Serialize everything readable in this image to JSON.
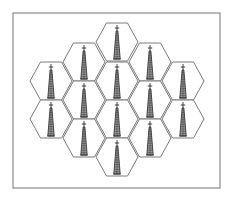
{
  "diagram": {
    "frame": {
      "x": 13,
      "y": 13,
      "width": 207,
      "height": 175,
      "stroke": "#8a8a8a"
    },
    "hex": {
      "width": 42,
      "height": 38,
      "stroke": "#7a7a7a",
      "fill": "#ffffff"
    },
    "tower": {
      "icon": "cell-tower-icon",
      "color": "#2e2e2e",
      "half_height": 17,
      "base_half_width": 3.2
    },
    "cells": [
      {
        "id": "cell-1",
        "cx": 117,
        "cy": 42
      },
      {
        "id": "cell-2",
        "cx": 84,
        "cy": 62
      },
      {
        "id": "cell-3",
        "cx": 150,
        "cy": 62
      },
      {
        "id": "cell-4",
        "cx": 51,
        "cy": 81
      },
      {
        "id": "cell-5",
        "cx": 117,
        "cy": 81
      },
      {
        "id": "cell-6",
        "cx": 183,
        "cy": 81
      },
      {
        "id": "cell-7",
        "cx": 84,
        "cy": 100
      },
      {
        "id": "cell-8",
        "cx": 150,
        "cy": 100
      },
      {
        "id": "cell-9",
        "cx": 51,
        "cy": 119
      },
      {
        "id": "cell-10",
        "cx": 117,
        "cy": 119
      },
      {
        "id": "cell-11",
        "cx": 183,
        "cy": 119
      },
      {
        "id": "cell-12",
        "cx": 84,
        "cy": 138
      },
      {
        "id": "cell-13",
        "cx": 150,
        "cy": 138
      },
      {
        "id": "cell-14",
        "cx": 117,
        "cy": 157
      }
    ]
  }
}
